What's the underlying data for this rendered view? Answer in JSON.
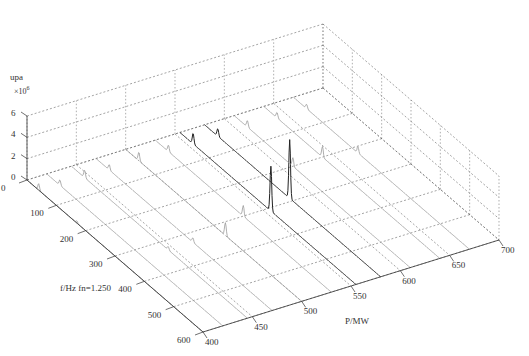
{
  "chart_data": {
    "type": "3d-waterfall",
    "title": "",
    "zlabel": "upa",
    "z_multiplier": "×10",
    "z_multiplier_exp": "6",
    "xlabel": "f/Hz fn=1.250",
    "ylabel": "P/MW",
    "x_axis": {
      "name": "f/Hz",
      "range": [
        0,
        600
      ],
      "ticks": [
        "0",
        "100",
        "200",
        "300",
        "400",
        "500",
        "600"
      ]
    },
    "y_axis": {
      "name": "P/MW",
      "range": [
        400,
        700
      ],
      "ticks": [
        "400",
        "450",
        "500",
        "550",
        "600",
        "650",
        "700"
      ]
    },
    "z_axis": {
      "name": "upa",
      "range": [
        0,
        6
      ],
      "ticks": [
        "0",
        "2",
        "4",
        "6"
      ]
    },
    "grid": true,
    "series": [
      {
        "P": 400,
        "peaks": [
          {
            "f": 40,
            "amp": 0.6
          },
          {
            "f": 170,
            "amp": 0.2
          }
        ]
      },
      {
        "P": 420,
        "peaks": [
          {
            "f": 45,
            "amp": 0.5
          }
        ]
      },
      {
        "P": 445,
        "peaks": [
          {
            "f": 45,
            "amp": 0.7
          },
          {
            "f": 330,
            "amp": 0.3
          }
        ]
      },
      {
        "P": 470,
        "peaks": [
          {
            "f": 45,
            "amp": 0.5
          },
          {
            "f": 330,
            "amp": 0.4
          }
        ]
      },
      {
        "P": 500,
        "peaks": [
          {
            "f": 45,
            "amp": 0.8
          },
          {
            "f": 340,
            "amp": 1.2
          }
        ]
      },
      {
        "P": 530,
        "peaks": [
          {
            "f": 45,
            "amp": 0.6
          },
          {
            "f": 300,
            "amp": 1.0
          }
        ]
      },
      {
        "P": 555,
        "peaks": [
          {
            "f": 45,
            "amp": 1.0
          },
          {
            "f": 310,
            "amp": 4.2
          }
        ]
      },
      {
        "P": 580,
        "peaks": [
          {
            "f": 45,
            "amp": 0.7
          },
          {
            "f": 290,
            "amp": 5.5
          }
        ]
      },
      {
        "P": 610,
        "peaks": [
          {
            "f": 45,
            "amp": 0.6
          },
          {
            "f": 200,
            "amp": 0.8
          }
        ]
      },
      {
        "P": 640,
        "peaks": [
          {
            "f": 45,
            "amp": 0.5
          },
          {
            "f": 200,
            "amp": 1.0
          }
        ]
      },
      {
        "P": 670,
        "peaks": [
          {
            "f": 45,
            "amp": 0.4
          },
          {
            "f": 220,
            "amp": 0.6
          }
        ]
      }
    ],
    "legend": null
  }
}
